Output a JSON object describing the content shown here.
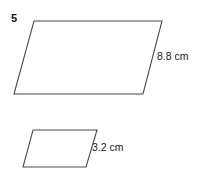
{
  "page": {
    "problem_number": "5",
    "background_color": "#ffffff",
    "stroke_color": "#4a4a4a",
    "text_color": "#1a1a1a"
  },
  "figures": [
    {
      "id": "large-parallelogram",
      "shape": "parallelogram",
      "label": "8.8 cm",
      "measurement_value": "8.8",
      "measurement_unit": "cm",
      "points": "34,21 162,21 143,94 14,94"
    },
    {
      "id": "small-parallelogram",
      "shape": "parallelogram",
      "label": "3.2 cm",
      "measurement_value": "3.2",
      "measurement_unit": "cm",
      "points": "33,130 97,130 86,167 23,167"
    }
  ]
}
